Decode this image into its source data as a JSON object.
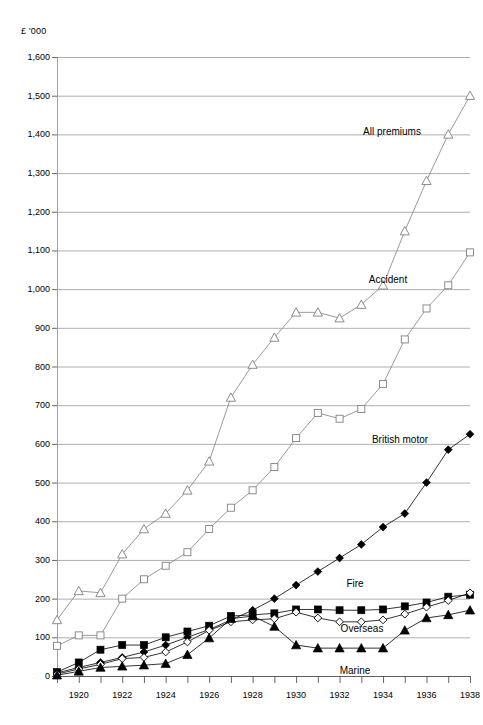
{
  "units_label": "£ '000",
  "axis": {
    "y_ticks": [
      "0",
      "100",
      "200",
      "300",
      "400",
      "500",
      "600",
      "700",
      "800",
      "900",
      "1,000",
      "1,100",
      "1,200",
      "1,300",
      "1,400",
      "1,500",
      "1,600"
    ],
    "x_ticks_labeled": [
      "1920",
      "1922",
      "1924",
      "1926",
      "1928",
      "1930",
      "1932",
      "1934",
      "1936",
      "1938"
    ]
  },
  "labels": {
    "all_premiums": "All premiums",
    "accident": "Accident",
    "british_motor": "British motor",
    "fire": "Fire",
    "overseas": "Overseas",
    "marine": "Marine"
  },
  "chart_data": {
    "type": "line",
    "title": "",
    "xlabel": "",
    "ylabel": "£ '000",
    "ylim": [
      0,
      1600
    ],
    "xlim": [
      1919,
      1938
    ],
    "grid": true,
    "legend_position": "inline-annotations",
    "y_tick_step": 100,
    "x_tick_step": 1,
    "x_label_step": 2,
    "x": [
      1919,
      1920,
      1921,
      1922,
      1923,
      1924,
      1925,
      1926,
      1927,
      1928,
      1929,
      1930,
      1931,
      1932,
      1933,
      1934,
      1935,
      1936,
      1937,
      1938
    ],
    "series": [
      {
        "name": "All premiums",
        "marker": "open-triangle",
        "color": "#808080",
        "values": [
          145,
          220,
          215,
          315,
          380,
          420,
          480,
          555,
          720,
          805,
          875,
          940,
          940,
          925,
          960,
          1010,
          1150,
          1280,
          1400,
          1500
        ]
      },
      {
        "name": "Accident",
        "marker": "open-square",
        "color": "#808080",
        "values": [
          78,
          105,
          105,
          200,
          250,
          285,
          320,
          380,
          435,
          480,
          540,
          615,
          680,
          665,
          690,
          755,
          870,
          950,
          1010,
          1095
        ]
      },
      {
        "name": "British motor",
        "marker": "filled-diamond",
        "color": "#000000",
        "values": [
          8,
          22,
          35,
          48,
          62,
          80,
          100,
          120,
          145,
          170,
          200,
          235,
          270,
          305,
          340,
          385,
          420,
          500,
          585,
          625
        ]
      },
      {
        "name": "Fire",
        "marker": "filled-square",
        "color": "#000000",
        "values": [
          10,
          35,
          68,
          80,
          80,
          100,
          115,
          130,
          155,
          158,
          162,
          172,
          172,
          170,
          170,
          172,
          180,
          190,
          205,
          210
        ]
      },
      {
        "name": "Overseas",
        "marker": "open-diamond",
        "color": "#000000",
        "values": [
          5,
          18,
          30,
          45,
          48,
          62,
          88,
          118,
          140,
          145,
          148,
          165,
          150,
          140,
          140,
          145,
          160,
          178,
          195,
          215
        ]
      },
      {
        "name": "Marine",
        "marker": "filled-triangle",
        "color": "#000000",
        "values": [
          2,
          12,
          22,
          25,
          28,
          32,
          55,
          98,
          148,
          155,
          128,
          80,
          72,
          72,
          72,
          72,
          118,
          150,
          158,
          170
        ]
      }
    ]
  }
}
